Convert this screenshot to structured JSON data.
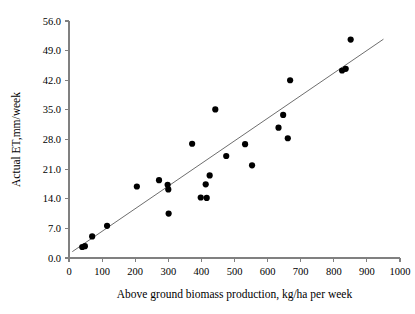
{
  "chart_data": {
    "type": "scatter",
    "title": "",
    "xlabel": "Above ground biomass production, kg/ha per week",
    "ylabel": "Actual ET,mm/week",
    "xlim": [
      0,
      1000
    ],
    "ylim": [
      0.0,
      56.0
    ],
    "xticks": [
      0,
      100,
      200,
      300,
      400,
      500,
      600,
      700,
      800,
      900,
      1000
    ],
    "xtick_labels": [
      "0",
      "100",
      "200",
      "300",
      "400",
      "500",
      "600",
      "700",
      "800",
      "900",
      "1000"
    ],
    "yticks": [
      0.0,
      7.0,
      14.0,
      21.0,
      28.0,
      35.0,
      42.0,
      49.0,
      56.0
    ],
    "ytick_labels": [
      "0.0",
      "7.0",
      "14.0",
      "21.0",
      "28.0",
      "35.0",
      "42.0",
      "49.0",
      "56.0"
    ],
    "grid": false,
    "legend": false,
    "point_color": "#000000",
    "trendline_color": "#6e6e6e",
    "axis_color": "#808080",
    "series": [
      {
        "name": "Observations",
        "marker": "filled-circle",
        "points": [
          [
            40,
            2.6
          ],
          [
            48,
            2.8
          ],
          [
            70,
            5.1
          ],
          [
            115,
            7.6
          ],
          [
            205,
            16.9
          ],
          [
            272,
            18.4
          ],
          [
            298,
            17.3
          ],
          [
            300,
            16.2
          ],
          [
            301,
            10.5
          ],
          [
            372,
            27.0
          ],
          [
            398,
            14.3
          ],
          [
            413,
            17.4
          ],
          [
            416,
            14.2
          ],
          [
            425,
            19.5
          ],
          [
            442,
            35.1
          ],
          [
            475,
            24.1
          ],
          [
            532,
            26.9
          ],
          [
            553,
            21.9
          ],
          [
            633,
            30.8
          ],
          [
            647,
            33.8
          ],
          [
            661,
            28.3
          ],
          [
            668,
            42.0
          ],
          [
            825,
            44.3
          ],
          [
            836,
            44.7
          ],
          [
            851,
            51.6
          ]
        ]
      }
    ],
    "trendline": {
      "name": "Linear fit",
      "x_start": 10,
      "y_start": 1.5,
      "x_end": 950,
      "y_end": 51.7
    }
  }
}
